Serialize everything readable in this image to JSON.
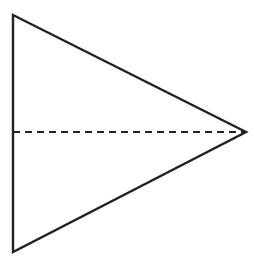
{
  "diagram": {
    "shape": "triangle",
    "stroke_color": "#222222",
    "background": "#ffffff",
    "vertices": {
      "top_left": [
        13,
        15
      ],
      "right": [
        246,
        132
      ],
      "bottom_left": [
        13,
        252
      ]
    },
    "axis_of_symmetry": {
      "style": "dashed",
      "from": [
        13,
        132
      ],
      "to": [
        246,
        132
      ]
    }
  }
}
